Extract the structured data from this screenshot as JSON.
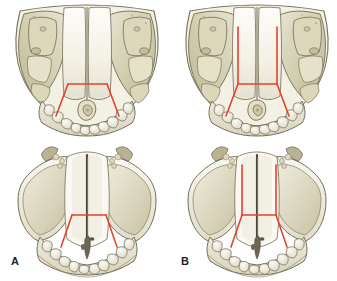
{
  "figure": {
    "kind": "anatomical-illustration",
    "background_color": "#ffffff",
    "width": 337,
    "height": 281,
    "panel_count": 2,
    "views_per_panel": 2
  },
  "colors": {
    "osteotomy_line": "#e8402f",
    "bone_light": "#f7f5ee",
    "bone_mid": "#e3dfcd",
    "bone_shade": "#cfcaa9",
    "bone_deep": "#b5ae8c",
    "outline": "#6d6a56",
    "outline_soft": "#9a9580",
    "suture_dark": "#4a4538",
    "label_color": "#231f20",
    "background": "#ffffff"
  },
  "panels": [
    {
      "id": "A",
      "label": "A",
      "label_position": {
        "x": 11,
        "y": 256
      },
      "column": "left",
      "views": [
        {
          "id": "A-superior",
          "name": "superior-view",
          "position": "top",
          "osteotomy": {
            "pattern": "trapezoid",
            "has_vertical_extensions": false,
            "segments": [
              "transverse-anterior",
              "left-oblique",
              "right-oblique"
            ]
          }
        },
        {
          "id": "A-inferior",
          "name": "inferior-view",
          "position": "bottom",
          "osteotomy": {
            "pattern": "trapezoid",
            "has_vertical_extensions": false,
            "segments": [
              "transverse-anterior",
              "left-oblique",
              "right-oblique"
            ]
          }
        }
      ]
    },
    {
      "id": "B",
      "label": "B",
      "label_position": {
        "x": 181,
        "y": 256
      },
      "column": "right",
      "views": [
        {
          "id": "B-superior",
          "name": "superior-view",
          "position": "top",
          "osteotomy": {
            "pattern": "trapezoid-with-paramedian-extensions",
            "has_vertical_extensions": true,
            "vertical_extension_count": 2,
            "segments": [
              "left-paramedian-vertical",
              "right-paramedian-vertical",
              "transverse-anterior",
              "left-oblique",
              "right-oblique"
            ]
          }
        },
        {
          "id": "B-inferior",
          "name": "inferior-view",
          "position": "bottom",
          "osteotomy": {
            "pattern": "trapezoid-with-paramedian-extensions",
            "has_vertical_extensions": true,
            "vertical_extension_count": 2,
            "segments": [
              "left-paramedian-vertical",
              "right-paramedian-vertical",
              "transverse-anterior",
              "left-oblique",
              "right-oblique"
            ]
          }
        }
      ]
    }
  ]
}
